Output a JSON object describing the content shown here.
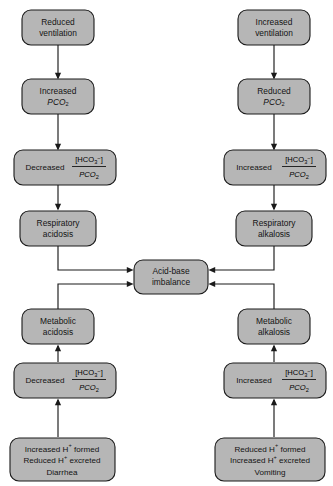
{
  "diagram": {
    "type": "flowchart",
    "background_color": "#ffffff",
    "node_fill_color": "#b6b6b6",
    "node_stroke_color": "#1a1a1a",
    "columns": [
      "respiratory-acidosis-pathway",
      "respiratory-alkalosis-pathway",
      "metabolic-acidosis-pathway",
      "metabolic-alkalosis-pathway"
    ],
    "nodes": {
      "reduced_ventilation": {
        "line1": "Reduced",
        "line2": "ventilation"
      },
      "increased_ventilation": {
        "line1": "Increased",
        "line2": "ventilation"
      },
      "increased_pco2": {
        "line1": "Increased",
        "line2_prefix": "P",
        "line2_main": "CO",
        "line2_sub": "2"
      },
      "reduced_pco2": {
        "line1": "Reduced",
        "line2_prefix": "P",
        "line2_main": "CO",
        "line2_sub": "2"
      },
      "decreased_ratio_top": {
        "label": "Decreased",
        "numerator_open": "[HCO",
        "numerator_sub": "3",
        "numerator_sup": "−",
        "numerator_close": "]",
        "denominator_prefix": "P",
        "denominator_main": "CO",
        "denominator_sub": "2"
      },
      "increased_ratio_top": {
        "label": "Increased",
        "numerator_open": "[HCO",
        "numerator_sub": "3",
        "numerator_sup": "−",
        "numerator_close": "]",
        "denominator_prefix": "P",
        "denominator_main": "CO",
        "denominator_sub": "2"
      },
      "respiratory_acidosis": {
        "line1": "Respiratory",
        "line2": "acidosis"
      },
      "respiratory_alkalosis": {
        "line1": "Respiratory",
        "line2": "alkalosis"
      },
      "acid_base_imbalance": {
        "line1": "Acid-base",
        "line2": "imbalance"
      },
      "metabolic_acidosis": {
        "line1": "Metabolic",
        "line2": "acidosis"
      },
      "metabolic_alkalosis": {
        "line1": "Metabolic",
        "line2": "alkalosis"
      },
      "decreased_ratio_bottom": {
        "label": "Decreased",
        "numerator_open": "[HCO",
        "numerator_sub": "3",
        "numerator_sup": "−",
        "numerator_close": "]",
        "denominator_prefix": "P",
        "denominator_main": "CO",
        "denominator_sub": "2"
      },
      "increased_ratio_bottom": {
        "label": "Increased",
        "numerator_open": "[HCO",
        "numerator_sub": "3",
        "numerator_sup": "−",
        "numerator_close": "]",
        "denominator_prefix": "P",
        "denominator_main": "CO",
        "denominator_sub": "2"
      },
      "metabolic_acidosis_causes": {
        "line1_a": "Increased H",
        "line1_sup": "+",
        "line1_b": " formed",
        "line2_a": "Reduced H",
        "line2_sup": "+",
        "line2_b": " excreted",
        "line3": "Diarrhea"
      },
      "metabolic_alkalosis_causes": {
        "line1_a": "Reduced H",
        "line1_sup": "+",
        "line1_b": " formed",
        "line2_a": "Increased H",
        "line2_sup": "+",
        "line2_b": " excreted",
        "line3": "Vomiting"
      }
    }
  }
}
